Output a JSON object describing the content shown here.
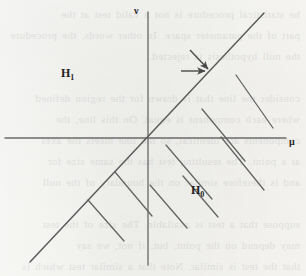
{
  "figure": {
    "background_color": "#f7f7f5",
    "ink_color": "#585858",
    "width": 306,
    "height": 276
  },
  "ghost_text": "he statistical procedure is not a valid test at the\npart of the parameter space. In other words, the procedure\nthe null hypothesis is rejected.\n\nconsider the line that is drawn for the region defined\nwhere each component is equal. On this line, the\ncomponents are identical, so the line meets the axes\nat a point. The resulting test has the same size for\nand is therefore similar on the boundary of the null\n\nsuppose that a test is available. The size of the test\nmay depend on the point, but, if not, we say\nthat the test is similar. Note that a similar test which is\nalso unbiased is necessarily of this type. If it is also\nthe case that the test is uniformly most powerful, then\nthe corresponding statistic has an attractive structure.",
  "axes": {
    "origin": {
      "x": 148,
      "y": 138
    },
    "x_axis": {
      "from_x": 5,
      "to_x": 286,
      "y": 138
    },
    "y_axis": {
      "x": 148,
      "from_y": 12,
      "to_y": 265
    },
    "x_label": "μ",
    "y_label": "ν"
  },
  "regions": [
    {
      "id": "h1",
      "label": "H",
      "subscript": "1",
      "position": {
        "x": 61,
        "y": 66
      },
      "description": "alternative hypothesis region, upper-left of the diagonal"
    },
    {
      "id": "h0",
      "label": "H",
      "subscript": "0",
      "position": {
        "x": 191,
        "y": 183
      },
      "description": "null hypothesis region, lower-right of the diagonal"
    }
  ],
  "lines": {
    "boundary_diagonal": {
      "x1": 30,
      "y1": 262,
      "x2": 264,
      "y2": 13,
      "description": "line mu = nu separating H0 from H1"
    },
    "hatching": [
      {
        "x1": 236,
        "y1": 75,
        "x2": 273,
        "y2": 128
      },
      {
        "x1": 202,
        "y1": 109,
        "x2": 245,
        "y2": 161
      },
      {
        "x1": 166,
        "y1": 145,
        "x2": 212,
        "y2": 199
      },
      {
        "x1": 221,
        "y1": 137,
        "x2": 264,
        "y2": 190
      },
      {
        "x1": 183,
        "y1": 176,
        "x2": 218,
        "y2": 217
      },
      {
        "x1": 150,
        "y1": 185,
        "x2": 187,
        "y2": 228
      },
      {
        "x1": 115,
        "y1": 172,
        "x2": 152,
        "y2": 216
      },
      {
        "x1": 88,
        "y1": 200,
        "x2": 124,
        "y2": 241
      }
    ]
  },
  "arrows": [
    {
      "id": "arrow-diagonal",
      "x1": 190,
      "y1": 50,
      "x2": 210,
      "y2": 71,
      "description": "arrow pointing down-right at the boundary line"
    },
    {
      "id": "arrow-horizontal",
      "x1": 181,
      "y1": 71,
      "x2": 209,
      "y2": 71,
      "description": "horizontal arrow pointing right at the boundary line"
    }
  ]
}
